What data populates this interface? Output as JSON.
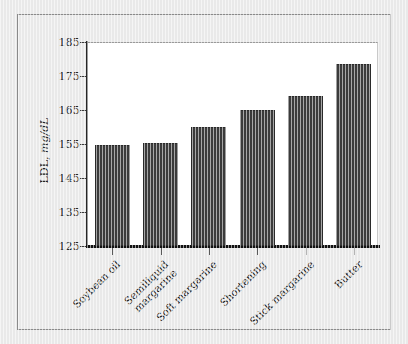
{
  "chart_data": {
    "type": "bar",
    "title": "",
    "xlabel": "",
    "ylabel": "LDL, mg/dL",
    "ylabel_main": "LDL,",
    "ylabel_unit": "mg/dL",
    "ylim": [
      125,
      185
    ],
    "yticks": [
      125,
      135,
      145,
      155,
      165,
      175,
      185
    ],
    "grid": false,
    "legend": "none",
    "bar_color": "#3b3b3b",
    "plot_background": "#ffffff",
    "figure_background": "#e9e9e9",
    "categories": [
      "Soybean oil",
      "Semiliquid margarine",
      "Soft margarine",
      "Shortening",
      "Stick margarine",
      "Butter"
    ],
    "category_lines": [
      [
        "Soybean oil"
      ],
      [
        "Semiliquid",
        "margarine"
      ],
      [
        "Soft margarine"
      ],
      [
        "Shortening"
      ],
      [
        "Stick margarine"
      ],
      [
        "Butter"
      ]
    ],
    "values": [
      154.8,
      155.3,
      160.0,
      165.0,
      169.0,
      178.5
    ]
  }
}
